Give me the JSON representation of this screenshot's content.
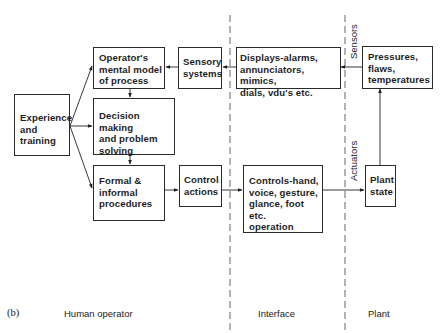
{
  "diagram": {
    "figure_label": "(b)",
    "sections": [
      {
        "id": "human_operator",
        "label": "Human operator"
      },
      {
        "id": "interface",
        "label": "Interface"
      },
      {
        "id": "plant",
        "label": "Plant"
      }
    ],
    "boundary_labels": {
      "sensors": "Sensors",
      "actuators": "Actuators"
    },
    "nodes": {
      "experience": "Experience\nand\ntraining",
      "mental_model": "Operator's\nmental model\nof process",
      "decision": "Decision making\nand problem\nsolving",
      "procedures": "Formal &\ninformal\nprocedures",
      "sensory": "Sensory\nsystems",
      "control_actions": "Control\nactions",
      "displays": "Displays-alarms,\nannunciators, mimics,\ndials, vdu's etc.",
      "controls": "Controls-hand,\nvoice, gesture,\nglance, foot etc.\noperation",
      "pressures": "Pressures,\nflaws,\ntemperatures",
      "plant_state": "Plant\nstate"
    },
    "edges": [
      {
        "from": "experience",
        "to": "mental_model"
      },
      {
        "from": "experience",
        "to": "decision"
      },
      {
        "from": "experience",
        "to": "procedures"
      },
      {
        "from": "mental_model",
        "to": "decision"
      },
      {
        "from": "decision",
        "to": "procedures"
      },
      {
        "from": "procedures",
        "to": "control_actions"
      },
      {
        "from": "control_actions",
        "to": "controls"
      },
      {
        "from": "controls",
        "to": "plant_state"
      },
      {
        "from": "plant_state",
        "to": "pressures"
      },
      {
        "from": "pressures",
        "to": "displays"
      },
      {
        "from": "displays",
        "to": "sensory"
      },
      {
        "from": "sensory",
        "to": "mental_model"
      }
    ]
  }
}
